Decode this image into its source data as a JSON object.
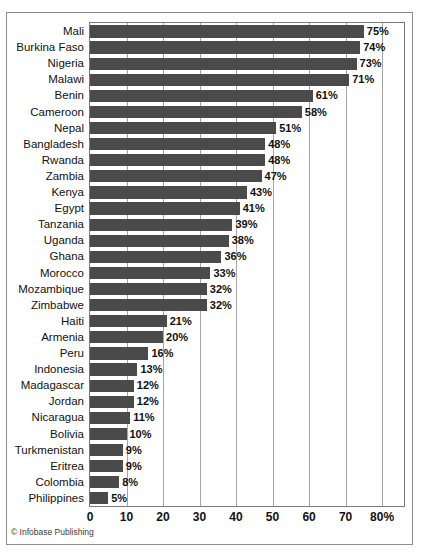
{
  "chart_data": {
    "type": "bar",
    "orientation": "horizontal",
    "title": "",
    "xlabel": "",
    "ylabel": "",
    "xlim": [
      0,
      86
    ],
    "grid": true,
    "legend": null,
    "bar_color": "#4a4a4a",
    "value_suffix": "%",
    "xticks": [
      {
        "value": 0,
        "label": "0"
      },
      {
        "value": 10,
        "label": "10"
      },
      {
        "value": 20,
        "label": "20"
      },
      {
        "value": 30,
        "label": "30"
      },
      {
        "value": 40,
        "label": "40"
      },
      {
        "value": 50,
        "label": "50"
      },
      {
        "value": 60,
        "label": "60"
      },
      {
        "value": 70,
        "label": "70"
      },
      {
        "value": 80,
        "label": "80%"
      }
    ],
    "categories": [
      "Mali",
      "Burkina Faso",
      "Nigeria",
      "Malawi",
      "Benin",
      "Cameroon",
      "Nepal",
      "Bangladesh",
      "Rwanda",
      "Zambia",
      "Kenya",
      "Egypt",
      "Tanzania",
      "Uganda",
      "Ghana",
      "Morocco",
      "Mozambique",
      "Zimbabwe",
      "Haiti",
      "Armenia",
      "Peru",
      "Indonesia",
      "Madagascar",
      "Jordan",
      "Nicaragua",
      "Bolivia",
      "Turkmenistan",
      "Eritrea",
      "Colombia",
      "Philippines"
    ],
    "values": [
      75,
      74,
      73,
      71,
      61,
      58,
      51,
      48,
      48,
      47,
      43,
      41,
      39,
      38,
      36,
      33,
      32,
      32,
      21,
      20,
      16,
      13,
      12,
      12,
      11,
      10,
      9,
      9,
      8,
      5
    ],
    "value_labels": [
      "75%",
      "74%",
      "73%",
      "71%",
      "61%",
      "58%",
      "51%",
      "48%",
      "48%",
      "47%",
      "43%",
      "41%",
      "39%",
      "38%",
      "36%",
      "33%",
      "32%",
      "32%",
      "21%",
      "20%",
      "16%",
      "13%",
      "12%",
      "12%",
      "11%",
      "10%",
      "9%",
      "9%",
      "8%",
      "5%"
    ]
  },
  "credit": "© Infobase Publishing"
}
